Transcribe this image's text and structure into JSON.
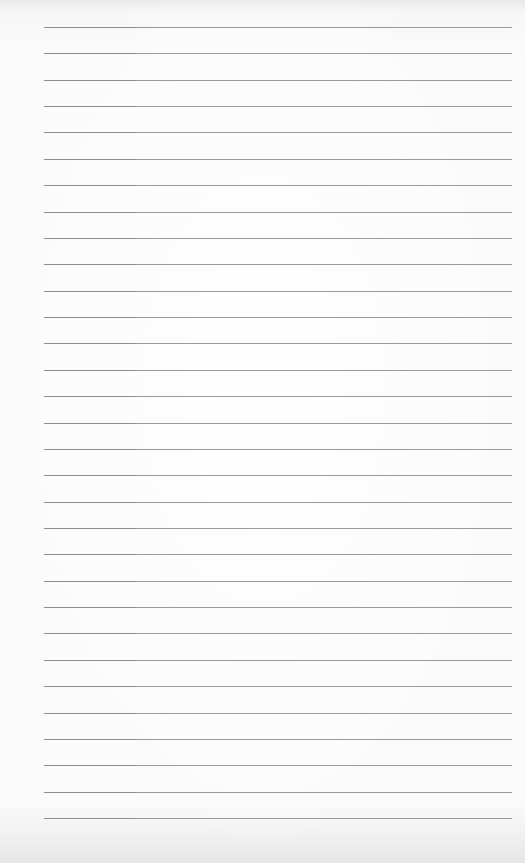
{
  "scene": {
    "description": "Photo of a blank lined paper sheet",
    "line_count": 31,
    "paper_color": "#fbfbfb",
    "line_color": "#959595"
  }
}
